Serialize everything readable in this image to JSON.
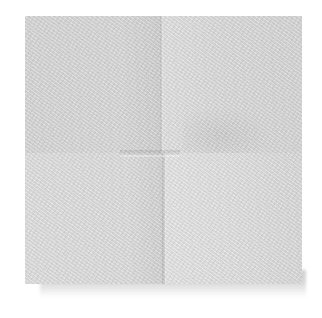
{
  "image": {
    "subject": "Folded nonwoven gauze pad",
    "description": "Square white/light-gray gauze swab with a cross-shaped fold, resting on a slightly offset lower layer against a white background",
    "colors": {
      "background": "#ffffff",
      "pad_base": "#d8d8d8",
      "pad_light": "#e2e2e2",
      "pad_shadow": "#cdcdcd"
    },
    "regions": {
      "pad": {
        "x": 25,
        "y": 16,
        "width": 277,
        "height": 268
      },
      "under_layer": {
        "x": 40,
        "y": 270,
        "width": 266,
        "height": 28
      },
      "center_crease": {
        "x": 120,
        "y": 150,
        "width": 60,
        "height": 5
      }
    }
  }
}
